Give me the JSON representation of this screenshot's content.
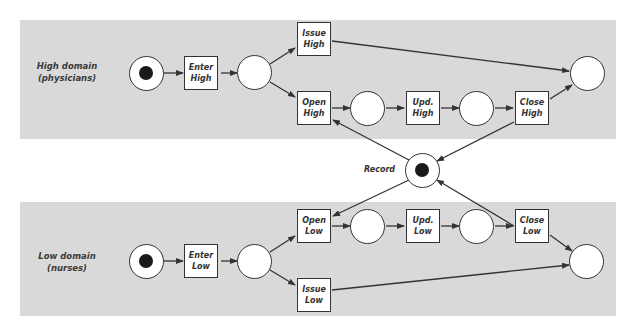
{
  "diagram": {
    "type": "petri-net",
    "colors": {
      "band_background": "#d9d9d9",
      "stroke": "#333333",
      "token": "#1a1a1a",
      "node_fill": "#ffffff"
    },
    "high_domain": {
      "label_line1": "High domain",
      "label_line2": "(physicians)",
      "transitions": {
        "enter": {
          "line1": "Enter",
          "line2": "High"
        },
        "issue": {
          "line1": "Issue",
          "line2": "High"
        },
        "open": {
          "line1": "Open",
          "line2": "High"
        },
        "update": {
          "line1": "Upd.",
          "line2": "High"
        },
        "close": {
          "line1": "Close",
          "line2": "High"
        }
      },
      "places": [
        "start (marked)",
        "after-enter",
        "after-open",
        "after-update",
        "end"
      ]
    },
    "low_domain": {
      "label_line1": "Low domain",
      "label_line2": "(nurses)",
      "transitions": {
        "enter": {
          "line1": "Enter",
          "line2": "Low"
        },
        "issue": {
          "line1": "Issue",
          "line2": "Low"
        },
        "open": {
          "line1": "Open",
          "line2": "Low"
        },
        "update": {
          "line1": "Upd.",
          "line2": "Low"
        },
        "close": {
          "line1": "Close",
          "line2": "Low"
        }
      },
      "places": [
        "start (marked)",
        "after-enter",
        "after-open",
        "after-update",
        "end"
      ]
    },
    "shared": {
      "record_label": "Record"
    },
    "arcs": [
      [
        "Start High",
        "Enter High"
      ],
      [
        "Enter High",
        "P High 1"
      ],
      [
        "P High 1",
        "Issue High"
      ],
      [
        "P High 1",
        "Open High"
      ],
      [
        "Issue High",
        "End High"
      ],
      [
        "Open High",
        "P High 2"
      ],
      [
        "P High 2",
        "Upd. High"
      ],
      [
        "Upd. High",
        "P High 3"
      ],
      [
        "P High 3",
        "Close High"
      ],
      [
        "Close High",
        "End High"
      ],
      [
        "Record",
        "Open High"
      ],
      [
        "Close High",
        "Record"
      ],
      [
        "Record",
        "Open Low"
      ],
      [
        "Close Low",
        "Record"
      ],
      [
        "Start Low",
        "Enter Low"
      ],
      [
        "Enter Low",
        "P Low 1"
      ],
      [
        "P Low 1",
        "Open Low"
      ],
      [
        "P Low 1",
        "Issue Low"
      ],
      [
        "Open Low",
        "P Low 2"
      ],
      [
        "P Low 2",
        "Upd. Low"
      ],
      [
        "Upd. Low",
        "P Low 3"
      ],
      [
        "P Low 3",
        "Close Low"
      ],
      [
        "Close Low",
        "End Low"
      ],
      [
        "Issue Low",
        "End Low"
      ]
    ]
  }
}
